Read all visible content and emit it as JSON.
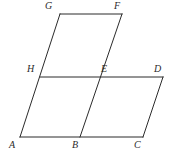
{
  "figure": {
    "type": "geometry-diagram",
    "stroke_color": "#2b2b2b",
    "label_color": "#2b2b2b",
    "background_color": "#ffffff",
    "stroke_width": 1,
    "canvas": {
      "width": 173,
      "height": 157
    },
    "points": {
      "A": {
        "label": "A",
        "x": 20,
        "y": 137,
        "label_x": 9,
        "label_y": 140
      },
      "B": {
        "label": "B",
        "x": 80,
        "y": 137,
        "label_x": 72,
        "label_y": 140
      },
      "C": {
        "label": "C",
        "x": 143,
        "y": 137,
        "label_x": 134,
        "label_y": 140
      },
      "D": {
        "label": "D",
        "x": 163,
        "y": 77,
        "label_x": 154,
        "label_y": 64
      },
      "E": {
        "label": "E",
        "x": 100,
        "y": 77,
        "label_x": 101,
        "label_y": 64
      },
      "F": {
        "label": "F",
        "x": 122,
        "y": 14,
        "label_x": 114,
        "label_y": 1
      },
      "G": {
        "label": "G",
        "x": 60,
        "y": 14,
        "label_x": 45,
        "label_y": 1
      },
      "H": {
        "label": "H",
        "x": 40,
        "y": 77,
        "label_x": 27,
        "label_y": 64
      }
    },
    "segments": [
      {
        "name": "segment-A-G",
        "from": "A",
        "to": "G"
      },
      {
        "name": "segment-G-F",
        "from": "G",
        "to": "F"
      },
      {
        "name": "segment-F-B",
        "from": "F",
        "to": "B"
      },
      {
        "name": "segment-A-C",
        "from": "A",
        "to": "C"
      },
      {
        "name": "segment-H-D",
        "from": "H",
        "to": "D"
      },
      {
        "name": "segment-D-C",
        "from": "D",
        "to": "C"
      }
    ]
  }
}
